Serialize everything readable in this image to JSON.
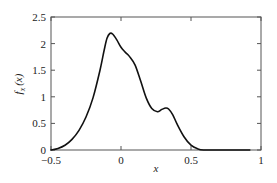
{
  "chart_data": {
    "type": "line",
    "title": "",
    "xlabel": "x",
    "ylabel": "f_x(x)",
    "ylabel_main": "f",
    "ylabel_sub": "x",
    "ylabel_arg": "(x)",
    "xlim": [
      -0.5,
      1
    ],
    "ylim": [
      0,
      2.5
    ],
    "grid": false,
    "legend": null,
    "x_ticks": [
      -0.5,
      0,
      0.5,
      1
    ],
    "x_tick_labels": [
      "−0.5",
      "0",
      "0.5",
      "1"
    ],
    "y_ticks": [
      0,
      0.5,
      1,
      1.5,
      2,
      2.5
    ],
    "y_tick_labels": [
      "0",
      "0.5",
      "1",
      "1.5",
      "2",
      "2.5"
    ],
    "series": [
      {
        "name": "f_x(x)",
        "color": "#111111",
        "x": [
          -0.5,
          -0.45,
          -0.4,
          -0.35,
          -0.3,
          -0.25,
          -0.2,
          -0.15,
          -0.12,
          -0.1,
          -0.08,
          -0.06,
          -0.03,
          0.0,
          0.03,
          0.06,
          0.1,
          0.14,
          0.18,
          0.22,
          0.26,
          0.29,
          0.32,
          0.34,
          0.37,
          0.4,
          0.45,
          0.5,
          0.55,
          0.59,
          0.65,
          0.75,
          0.85,
          0.92
        ],
        "y": [
          0.0,
          0.03,
          0.09,
          0.2,
          0.37,
          0.62,
          0.98,
          1.5,
          1.88,
          2.1,
          2.19,
          2.18,
          2.07,
          1.93,
          1.84,
          1.76,
          1.6,
          1.3,
          0.98,
          0.78,
          0.72,
          0.76,
          0.79,
          0.77,
          0.66,
          0.49,
          0.25,
          0.09,
          0.02,
          0.0,
          0.0,
          0.0,
          0.0,
          0.0
        ]
      }
    ]
  }
}
